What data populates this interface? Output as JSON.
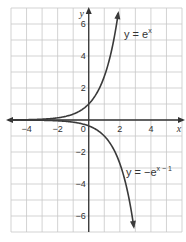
{
  "chart_data": {
    "type": "line",
    "title": "",
    "xlabel": "x",
    "ylabel": "y",
    "xlim": [
      -5,
      6
    ],
    "ylim": [
      -7,
      7
    ],
    "grid": true,
    "x_ticks": [
      -4,
      -2,
      2,
      4
    ],
    "y_ticks": [
      6,
      4,
      2,
      -2,
      -4,
      -6
    ],
    "origin_label": "0",
    "series": [
      {
        "name": "y = e^x",
        "label_main": "y = e",
        "label_exp": "x",
        "x": [
          -5,
          -4,
          -3,
          -2,
          -1,
          0,
          0.5,
          1,
          1.5,
          1.9
        ],
        "y": [
          0.007,
          0.018,
          0.05,
          0.135,
          0.368,
          1,
          1.65,
          2.72,
          4.48,
          6.69
        ]
      },
      {
        "name": "y = -e^(x-1)",
        "label_main": "y = −e",
        "label_exp": "x − 1",
        "x": [
          -5,
          -4,
          -3,
          -2,
          -1,
          0,
          1,
          1.5,
          2,
          2.5,
          2.9
        ],
        "y": [
          -0.002,
          -0.007,
          -0.018,
          -0.05,
          -0.135,
          -0.368,
          -1,
          -1.65,
          -2.72,
          -4.48,
          -6.69
        ]
      }
    ]
  }
}
